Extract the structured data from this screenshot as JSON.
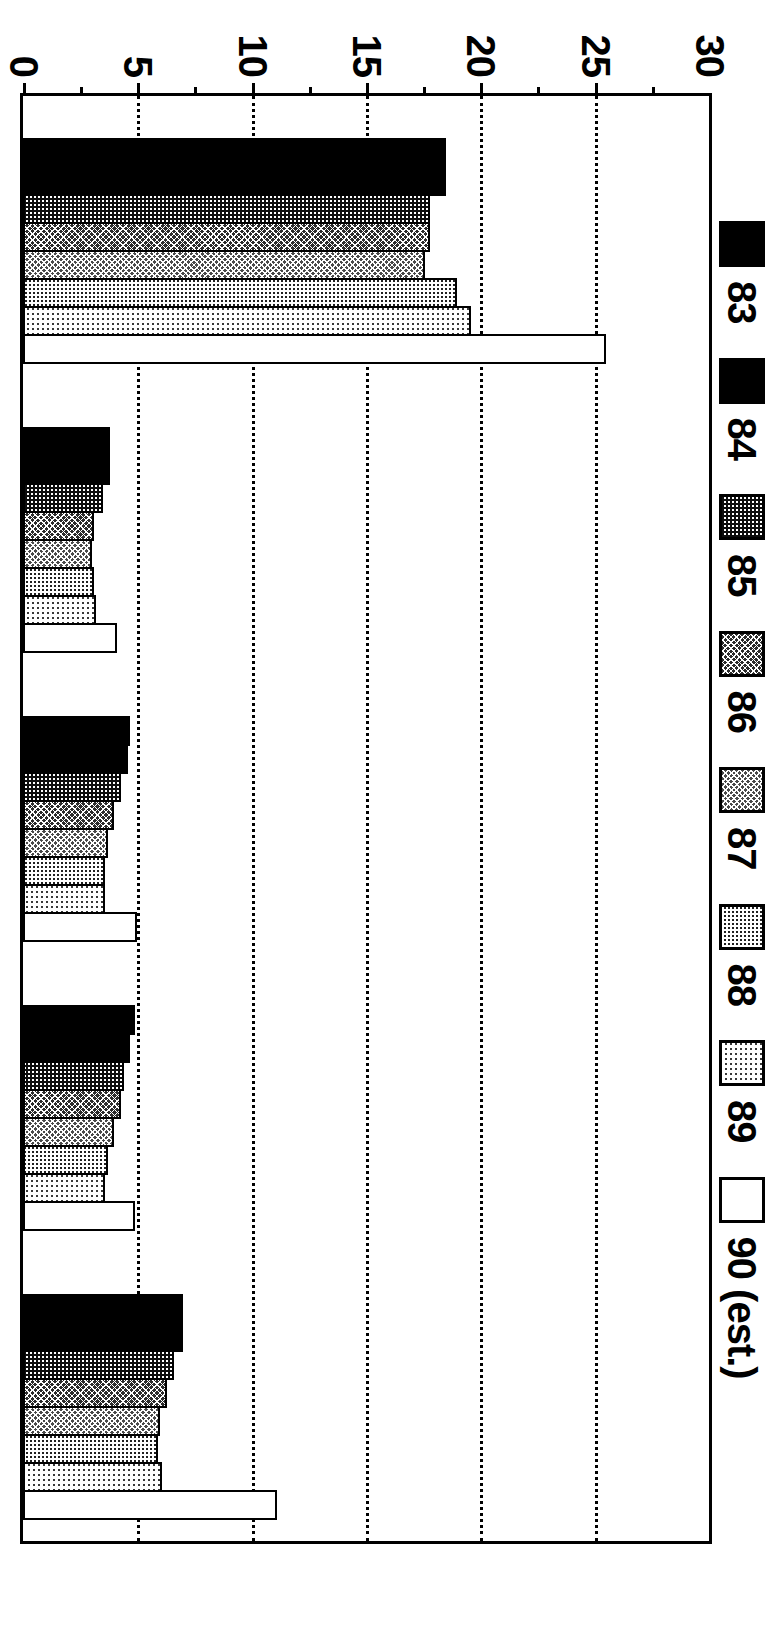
{
  "chart_data": {
    "type": "bar",
    "orientation": "vertical-printed-rotated",
    "title": "",
    "subtitle": "",
    "xlabel": "",
    "ylabel": "",
    "ylim": [
      0,
      30
    ],
    "yticks": [
      0,
      5,
      10,
      15,
      20,
      25,
      30
    ],
    "ytick_labels": [
      "0",
      "5",
      "10",
      "15",
      "20",
      "25",
      "30"
    ],
    "minor_ticks": [
      2.5,
      7.5,
      12.5,
      17.5,
      22.5,
      27.5
    ],
    "grid": "dotted-horizontal",
    "legend_position": "top-left",
    "categories": [
      "U.S. Total",
      "Northeast",
      "Midwest",
      "West",
      "South"
    ],
    "series": [
      {
        "name": "83",
        "pattern": "solid-black",
        "values": [
          18.5,
          3.8,
          4.7,
          4.9,
          7.0
        ]
      },
      {
        "name": "84",
        "pattern": "solid-black",
        "values": [
          18.5,
          3.8,
          4.6,
          4.7,
          7.0
        ]
      },
      {
        "name": "85",
        "pattern": "dense-dot-dark",
        "values": [
          17.8,
          3.5,
          4.3,
          4.4,
          6.6
        ]
      },
      {
        "name": "86",
        "pattern": "crosshatch-dark",
        "values": [
          17.8,
          3.1,
          4.0,
          4.3,
          6.3
        ]
      },
      {
        "name": "87",
        "pattern": "crosshatch-medium",
        "values": [
          17.6,
          3.0,
          3.7,
          4.0,
          6.0
        ]
      },
      {
        "name": "88",
        "pattern": "dot-medium",
        "values": [
          19.0,
          3.1,
          3.6,
          3.7,
          5.9
        ]
      },
      {
        "name": "89",
        "pattern": "dot-light",
        "values": [
          19.6,
          3.2,
          3.6,
          3.6,
          6.1
        ]
      },
      {
        "name": "90 (est.)",
        "pattern": "empty-white",
        "values": [
          25.5,
          4.1,
          5.0,
          4.9,
          11.1
        ]
      }
    ],
    "legend_entries": [
      {
        "label": "83",
        "pattern": "solid-black"
      },
      {
        "label": "84",
        "pattern": "solid-black"
      },
      {
        "label": "85",
        "pattern": "dense-dot-dark"
      },
      {
        "label": "86",
        "pattern": "crosshatch-dark"
      },
      {
        "label": "87",
        "pattern": "crosshatch-medium"
      },
      {
        "label": "88",
        "pattern": "dot-medium"
      },
      {
        "label": "89",
        "pattern": "dot-light"
      },
      {
        "label": "90 (est.)",
        "pattern": "empty-white"
      }
    ],
    "colors": {
      "foreground": "#000000",
      "background": "#ffffff"
    }
  }
}
